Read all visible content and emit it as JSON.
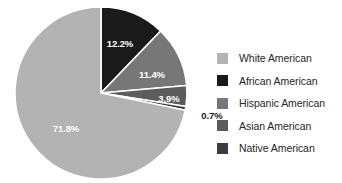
{
  "chart_data": {
    "type": "pie",
    "title": "",
    "subtitle": "",
    "xlabel": "",
    "ylabel": "",
    "grid": false,
    "legend_position": "right",
    "start_angle_deg": 0,
    "direction": "clockwise",
    "categories": [
      "White American",
      "African American",
      "Hispanic American",
      "Asian American",
      "Native American"
    ],
    "values": [
      71.8,
      12.2,
      11.4,
      3.9,
      0.7
    ],
    "value_labels": [
      "71.8%",
      "12.2%",
      "11.4%",
      "3.9%",
      "0.7%"
    ],
    "colors": [
      "#b3b3b3",
      "#1a1a1a",
      "#777777",
      "#5c5c5c",
      "#3d3d3d"
    ],
    "slice_order_clockwise": [
      "African American",
      "Hispanic American",
      "Asian American",
      "Native American",
      "White American"
    ],
    "separator_color": "#ffffff"
  },
  "pie": {
    "center_x": 101,
    "center_y": 93,
    "radius": 86,
    "labels": [
      {
        "name": "label-african-american",
        "text": "12.2%",
        "x": 120,
        "y": 44,
        "placement": "inside",
        "color": "#ffffff"
      },
      {
        "name": "label-hispanic-american",
        "text": "11.4%",
        "x": 152,
        "y": 75,
        "placement": "inside",
        "color": "#ffffff"
      },
      {
        "name": "label-asian-american",
        "text": "3.9%",
        "x": 169,
        "y": 99,
        "placement": "inside",
        "color": "#ffffff"
      },
      {
        "name": "label-native-american",
        "text": "0.7%",
        "x": 212,
        "y": 116,
        "placement": "outside",
        "color": "#1a1a1a"
      },
      {
        "name": "label-white-american",
        "text": "71.8%",
        "x": 66,
        "y": 129,
        "placement": "inside",
        "color": "#ffffff"
      }
    ]
  },
  "legend": {
    "items": [
      {
        "label": "White American",
        "color": "#b3b3b3",
        "swatch_name": "legend-swatch-white-american"
      },
      {
        "label": "African American",
        "color": "#1a1a1a",
        "swatch_name": "legend-swatch-african-american"
      },
      {
        "label": "Hispanic American",
        "color": "#777777",
        "swatch_name": "legend-swatch-hispanic-american"
      },
      {
        "label": "Asian American",
        "color": "#5c5c5c",
        "swatch_name": "legend-swatch-asian-american"
      },
      {
        "label": "Native American",
        "color": "#3d3d3d",
        "swatch_name": "legend-swatch-native-american"
      }
    ]
  }
}
